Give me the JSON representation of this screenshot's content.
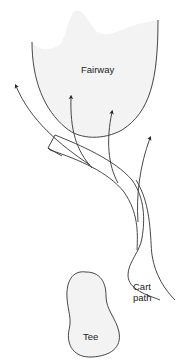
{
  "diagram": {
    "labels": {
      "fairway": "Fairway",
      "cart_path_line1": "Cart",
      "cart_path_line2": "path",
      "tee": "Tee"
    },
    "elements": {
      "fairway": {
        "shape": "U-shaped region, wavy faint top",
        "fill": "#f3f3f3",
        "stroke": "#333333"
      },
      "tee": {
        "shape": "peanut/bean outline",
        "fill": "#f3f3f3",
        "stroke": "#333333"
      },
      "cart_path": {
        "shape": "curving double-line path from bottom-right to upper-left, squared end",
        "stroke": "#333333"
      },
      "shot_arrows": [
        {
          "id": "far-left",
          "direction": "curving left, past fairway edge"
        },
        {
          "id": "center-left",
          "direction": "into fairway"
        },
        {
          "id": "center",
          "direction": "into fairway"
        },
        {
          "id": "right",
          "direction": "right of fairway"
        }
      ]
    },
    "colors": {
      "line": "#333333",
      "fill": "#f3f3f3",
      "background": "#ffffff"
    }
  }
}
